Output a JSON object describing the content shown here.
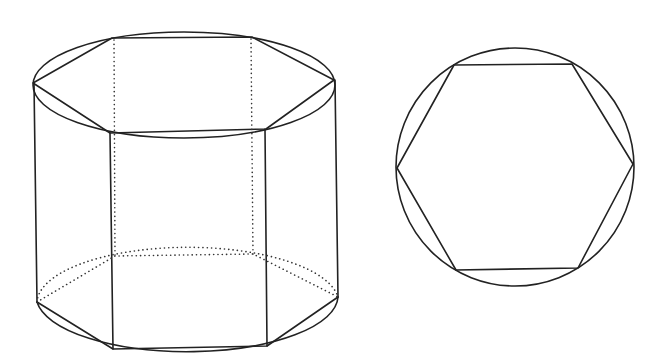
{
  "figure": {
    "colors": {
      "stroke": "#222222",
      "background": "#ffffff"
    },
    "left": {
      "name": "hexagonal-prism-in-cylinder",
      "top_ellipse": {
        "cx": 184,
        "cy": 85,
        "rx": 151,
        "ry": 53
      },
      "bottom_ellipse": {
        "cx": 187,
        "cy": 300,
        "rx": 151,
        "ry": 56
      },
      "top_hexagon": [
        [
          33,
          83
        ],
        [
          112,
          38
        ],
        [
          252,
          37
        ],
        [
          334,
          80
        ],
        [
          266,
          129
        ],
        [
          110,
          133
        ]
      ],
      "bottom_visible": [
        [
          37,
          302
        ],
        [
          113,
          349
        ],
        [
          267,
          346
        ],
        [
          338,
          297
        ]
      ],
      "bottom_hidden": [
        [
          115,
          256
        ],
        [
          253,
          254
        ]
      ],
      "vertical_edges_visible": [
        [
          [
            34,
            83
          ],
          [
            37,
            302
          ]
        ],
        [
          [
            110,
            133
          ],
          [
            113,
            349
          ]
        ],
        [
          [
            265,
            129
          ],
          [
            267,
            346
          ]
        ],
        [
          [
            335,
            80
          ],
          [
            338,
            297
          ]
        ]
      ],
      "vertical_edges_hidden": [
        [
          [
            114,
            39
          ],
          [
            115,
            256
          ]
        ],
        [
          [
            251,
            38
          ],
          [
            253,
            254
          ]
        ]
      ]
    },
    "right": {
      "name": "hexagon-in-circle",
      "circle": {
        "cx": 515,
        "cy": 167,
        "r": 119
      },
      "hexagon": [
        [
          397,
          168
        ],
        [
          454,
          65
        ],
        [
          572,
          64
        ],
        [
          633,
          164
        ],
        [
          578,
          268
        ],
        [
          456,
          270
        ]
      ]
    }
  }
}
